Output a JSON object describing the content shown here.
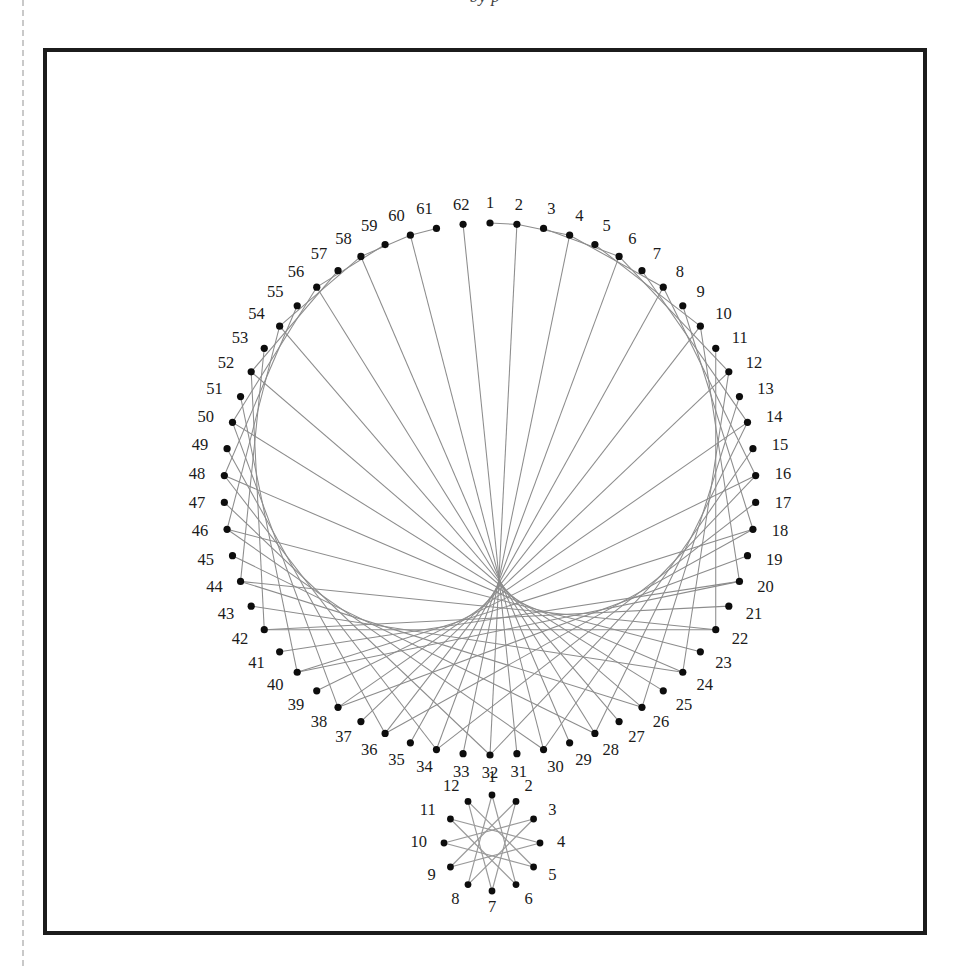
{
  "page": {
    "caption_sliver": "by p",
    "background": "#ffffff",
    "frame_color": "#1c1c1c",
    "dot_color": "#0d0d0d",
    "chord_color": "#8c8c8c",
    "label_color": "#1a1a1a"
  },
  "chart_data": {
    "type": "diagram",
    "xlabel": "",
    "ylabel": "",
    "figures": [
      {
        "name": "cardioid-62-point-circle",
        "kind": "modular-multiplication-circle",
        "point_count": 62,
        "multiplier": 2,
        "rule": "point n joins point (2n mod 62)",
        "center": [
          490,
          489
        ],
        "radius": 266,
        "start_angle_deg": -90,
        "label_offset": 19,
        "labels": [
          "1",
          "2",
          "3",
          "4",
          "5",
          "6",
          "7",
          "8",
          "9",
          "10",
          "11",
          "12",
          "13",
          "14",
          "15",
          "16",
          "17",
          "18",
          "19",
          "20",
          "21",
          "22",
          "23",
          "24",
          "25",
          "26",
          "27",
          "28",
          "29",
          "30",
          "31",
          "32",
          "33",
          "34",
          "35",
          "36",
          "37",
          "38",
          "39",
          "40",
          "41",
          "42",
          "43",
          "44",
          "45",
          "46",
          "47",
          "48",
          "49",
          "50",
          "51",
          "52",
          "53",
          "54",
          "55",
          "56",
          "57",
          "58",
          "59",
          "60",
          "61",
          "62"
        ]
      },
      {
        "name": "star-polygon-12-point",
        "kind": "star-polygon",
        "point_count": 12,
        "step": 5,
        "rule": "point n joins point (n+5 mod 12) — {12/5} star",
        "center": [
          492,
          843
        ],
        "radius": 48,
        "start_angle_deg": -90,
        "label_offset": 17,
        "labels": [
          "1",
          "2",
          "3",
          "4",
          "5",
          "6",
          "7",
          "8",
          "9",
          "10",
          "11",
          "12"
        ]
      }
    ]
  }
}
